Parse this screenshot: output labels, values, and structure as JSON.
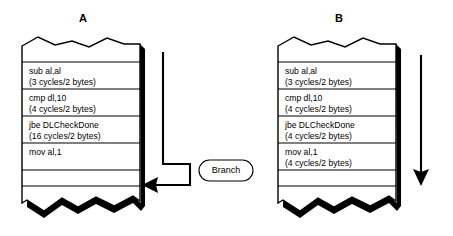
{
  "figure": {
    "type": "diagram",
    "background_color": "#ffffff",
    "line_color": "#000000",
    "panels": [
      {
        "id": "A",
        "label": "A",
        "rows": [
          {
            "instruction": "sub al,al",
            "timing": "(3 cycles/2 bytes)"
          },
          {
            "instruction": "cmp dl,10",
            "timing": "(4 cycles/2 bytes)"
          },
          {
            "instruction": "jbe DLCheckDone",
            "timing": "(16 cycles/2 bytes)"
          },
          {
            "instruction": "mov al,1",
            "timing": ""
          }
        ],
        "annotation": {
          "label": "Branch",
          "arrow": "branch-jump-arrow"
        }
      },
      {
        "id": "B",
        "label": "B",
        "rows": [
          {
            "instruction": "sub al,al",
            "timing": "(3 cycles/2 bytes)"
          },
          {
            "instruction": "cmp dl,10",
            "timing": "(4 cycles/2 bytes)"
          },
          {
            "instruction": "jbe DLCheckDone",
            "timing": "(4 cycles/2 bytes)"
          },
          {
            "instruction": "mov al,1",
            "timing": "(4 cycles/2 bytes)"
          }
        ],
        "annotation": {
          "label": "",
          "arrow": "sequential-flow-arrow"
        }
      }
    ]
  }
}
